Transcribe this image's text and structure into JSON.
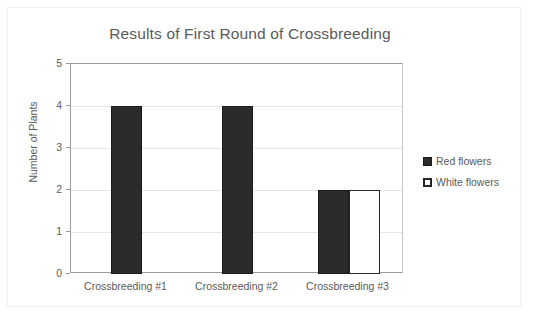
{
  "chart_data": {
    "type": "bar",
    "title": "Results of First Round of Crossbreeding",
    "xlabel": "",
    "ylabel": "Number of Plants",
    "categories": [
      "Crossbreeding #1",
      "Crossbreeding #2",
      "Crossbreeding #3"
    ],
    "series": [
      {
        "name": "Red flowers",
        "values": [
          4,
          4,
          2
        ],
        "color": "#2b2b2b"
      },
      {
        "name": "White flowers",
        "values": [
          0,
          0,
          2
        ],
        "color": "#ffffff"
      }
    ],
    "ylim": [
      0,
      5
    ],
    "ytick_labels": [
      "5",
      "4",
      "3",
      "2",
      "1",
      "0"
    ],
    "ytick_values": [
      5,
      4,
      3,
      2,
      1,
      0
    ],
    "grid": "horizontal",
    "legend_position": "right"
  },
  "legend": {
    "items": [
      {
        "label": "Red flowers",
        "marker": "filled-square-icon"
      },
      {
        "label": "White flowers",
        "marker": "hollow-square-icon"
      }
    ]
  },
  "colors": {
    "series_red": "#2b2b2b",
    "series_white": "#ffffff",
    "series_white_border": "#262626",
    "text": "#5a5a5a",
    "gridline": "#e6e6e6",
    "axis": "#9a9a9a",
    "frame": "#f2f2f2",
    "background": "#ffffff"
  }
}
